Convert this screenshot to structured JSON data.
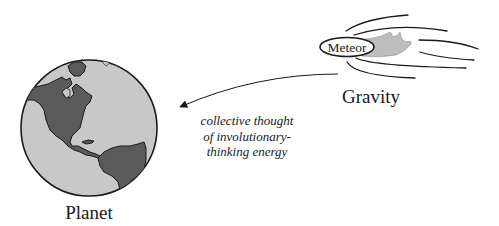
{
  "diagram": {
    "planet": {
      "label": "Planet",
      "icon": "globe-icon",
      "ocean_color": "#c8c8c8",
      "land_color": "#5a5a5a",
      "outline_color": "#1a1a1a"
    },
    "meteor": {
      "label": "Meteor",
      "icon": "meteor-icon",
      "flame_color": "#bdbdbd"
    },
    "gravity": {
      "label": "Gravity"
    },
    "arrow": {
      "direction": "from-gravity-to-planet",
      "caption_lines": [
        "collective thought",
        "of involutionary-",
        "thinking energy"
      ]
    }
  }
}
